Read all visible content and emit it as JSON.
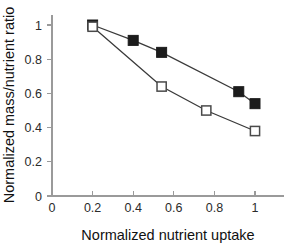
{
  "chart_data": {
    "type": "line",
    "title": "",
    "xlabel": "Normalized nutrient uptake",
    "ylabel": "Normalized mass/nutrient ratio",
    "xlim": [
      0,
      1.1
    ],
    "ylim": [
      0,
      1.1
    ],
    "xticks": [
      "0",
      "0.2",
      "0.4",
      "0.6",
      "0.8",
      "1"
    ],
    "xtick_values": [
      0,
      0.2,
      0.4,
      0.6,
      0.8,
      1
    ],
    "yticks": [
      "0",
      "0.2",
      "0.4",
      "0.6",
      "0.8",
      "1"
    ],
    "ytick_values": [
      0,
      0.2,
      0.4,
      0.6,
      0.8,
      1
    ],
    "grid": false,
    "legend_position": "none",
    "series": [
      {
        "name": "filled-squares",
        "marker": "filled-square",
        "color": "#1c1c1c",
        "x": [
          0.2,
          0.4,
          0.54,
          0.92,
          1.0
        ],
        "y": [
          1.0,
          0.91,
          0.84,
          0.61,
          0.54
        ]
      },
      {
        "name": "open-squares",
        "marker": "open-square",
        "color": "#ffffff",
        "x": [
          0.2,
          0.54,
          0.76,
          1.0
        ],
        "y": [
          0.99,
          0.64,
          0.5,
          0.38
        ]
      }
    ]
  },
  "axes": {
    "x_title": "Normalized nutrient uptake",
    "y_title": "Normalized mass/nutrient ratio"
  }
}
